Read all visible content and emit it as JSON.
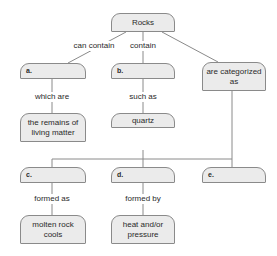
{
  "diagram": {
    "type": "concept-map",
    "nodes": {
      "root": "Rocks",
      "a": "a.",
      "b": "b.",
      "categorized": "are categorized as",
      "remains": "the remains of living matter",
      "quartz": "quartz",
      "c": "c.",
      "d": "d.",
      "e": "e.",
      "molten": "molten rock cools",
      "heat": "heat and/or pressure"
    },
    "links": {
      "can_contain": "can contain",
      "contain": "contain",
      "which_are": "which are",
      "such_as": "such as",
      "formed_as": "formed as",
      "formed_by": "formed by"
    },
    "colors": {
      "box_fill": "#ebebeb",
      "box_border": "#8a8a8a",
      "line": "#8a8a8a"
    }
  }
}
